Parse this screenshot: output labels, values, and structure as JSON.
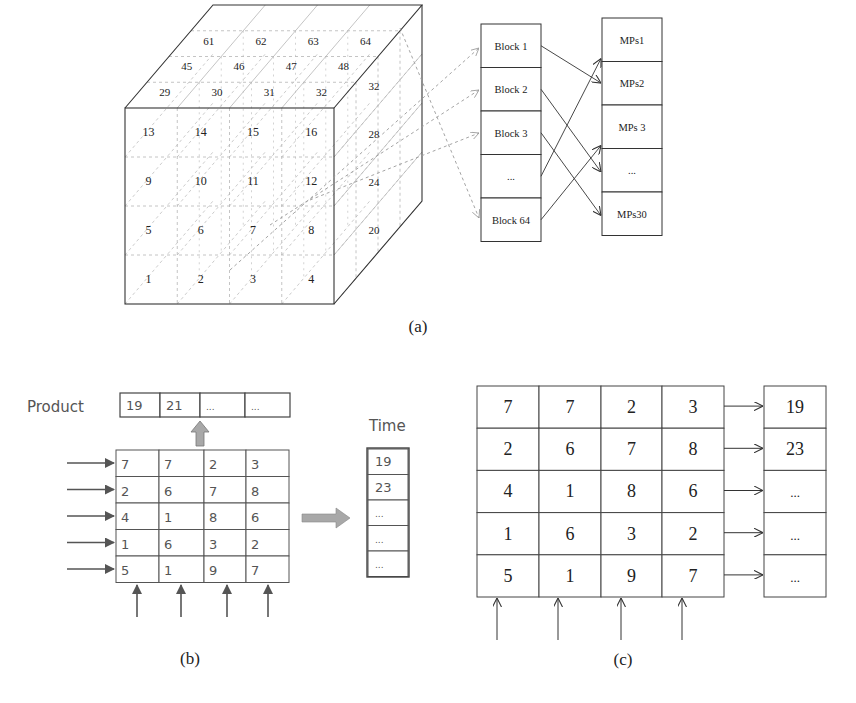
{
  "panel_a": {
    "caption": "(a)",
    "cube": {
      "front_numbers": [
        [
          "13",
          "14",
          "15",
          "16"
        ],
        [
          "9",
          "10",
          "11",
          "12"
        ],
        [
          "5",
          "6",
          "7",
          "8"
        ],
        [
          "1",
          "2",
          "3",
          "4"
        ]
      ],
      "top_numbers": [
        [
          "61",
          "62",
          "63",
          "64"
        ],
        [
          "45",
          "46",
          "47",
          "48"
        ],
        [
          "29",
          "30",
          "31",
          "32"
        ]
      ],
      "side_numbers": [
        "32",
        "28",
        "24",
        "20"
      ]
    },
    "blocks": [
      "Block 1",
      "Block 2",
      "Block 3",
      "...",
      "Block 64"
    ],
    "mps": [
      "MPs1",
      "MPs2",
      "MPs 3",
      "...",
      "MPs30"
    ],
    "block_to_mp": [
      [
        0,
        1
      ],
      [
        1,
        3
      ],
      [
        2,
        4
      ],
      [
        3,
        0
      ],
      [
        4,
        2
      ]
    ]
  },
  "panel_b": {
    "caption": "(b)",
    "product_label": "Product",
    "product_values": [
      "19",
      "21",
      "...",
      "..."
    ],
    "time_label": "Time",
    "time_values": [
      "19",
      "23",
      "...",
      "...",
      "..."
    ],
    "matrix": [
      [
        "7",
        "7",
        "2",
        "3"
      ],
      [
        "2",
        "6",
        "7",
        "8"
      ],
      [
        "4",
        "1",
        "8",
        "6"
      ],
      [
        "1",
        "6",
        "3",
        "2"
      ],
      [
        "5",
        "1",
        "9",
        "7"
      ]
    ]
  },
  "panel_c": {
    "caption": "(c)",
    "matrix": [
      [
        "7",
        "7",
        "2",
        "3"
      ],
      [
        "2",
        "6",
        "7",
        "8"
      ],
      [
        "4",
        "1",
        "8",
        "6"
      ],
      [
        "1",
        "6",
        "3",
        "2"
      ],
      [
        "5",
        "1",
        "9",
        "7"
      ]
    ],
    "results": [
      "19",
      "23",
      "...",
      "...",
      "..."
    ]
  },
  "colors": {
    "line": "#333333",
    "dashed": "#9a9a9a",
    "grid": "#b5b5b5",
    "text": "#222222",
    "sans_text": "#555555",
    "gray_arrow": "#a8a8a8"
  }
}
